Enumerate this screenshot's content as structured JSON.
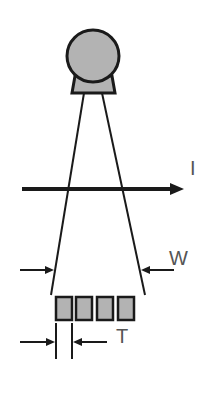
{
  "diagram": {
    "labels": {
      "current": "I",
      "width": "W",
      "thickness": "T"
    },
    "colors": {
      "stroke": "#1a1a1a",
      "fill": "#b3b3b3",
      "label": "#555555"
    },
    "element_count": 4
  }
}
